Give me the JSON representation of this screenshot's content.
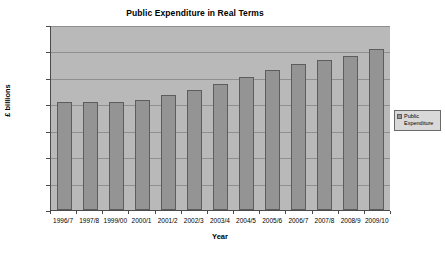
{
  "chart_data": {
    "type": "bar",
    "title": "Public Expenditure in Real Terms",
    "xlabel": "Year",
    "ylabel": "£ billions",
    "ylim": [
      0,
      700
    ],
    "ytick_step": 100,
    "yticks": [
      0,
      100,
      200,
      300,
      400,
      500,
      600,
      700
    ],
    "grid": true,
    "legend_position": "right",
    "categories": [
      "1996/7",
      "1997/8",
      "1999/00",
      "2000/1",
      "2001/2",
      "2002/3",
      "2003/4",
      "2004/5",
      "2005/6",
      "2006/7",
      "2007/8",
      "2008/9",
      "2009/10"
    ],
    "series": [
      {
        "name": "Public Expenditure",
        "color": "#949494",
        "values": [
          410,
          409,
          410,
          416,
          436,
          456,
          478,
          503,
          528,
          552,
          566,
          584,
          608
        ]
      }
    ]
  },
  "legend": {
    "entries": [
      {
        "label": "Public Expenditure"
      }
    ]
  },
  "colors": {
    "bar_fill": "#949494",
    "bar_border": "#5d5d5d",
    "plot_background": "#b9b9b9",
    "gridline": "#8f8f8f",
    "axis": "#4a4a4a",
    "text": "#000000"
  }
}
